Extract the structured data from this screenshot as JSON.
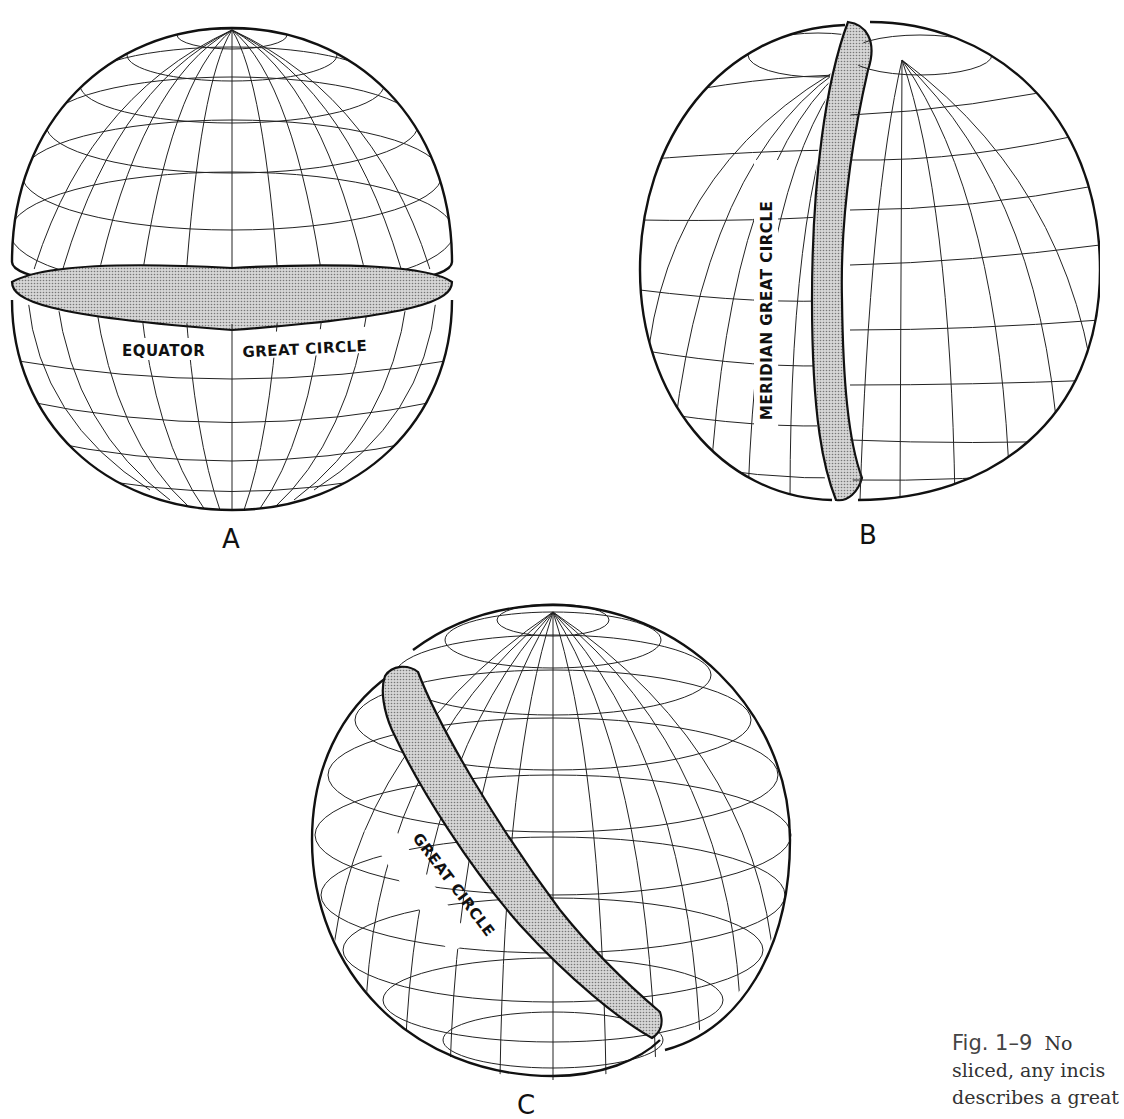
{
  "figure": {
    "number": "Fig. 1–9",
    "caption_lines": [
      "No",
      "sliced, any incis",
      "describes a great"
    ]
  },
  "panels": [
    {
      "id": "A",
      "letter": "A",
      "band_label_left": "EQUATOR",
      "band_label_right": "GREAT CIRCLE",
      "band_type": "equator"
    },
    {
      "id": "B",
      "letter": "B",
      "band_label": "MERIDIAN GREAT CIRCLE",
      "band_type": "meridian"
    },
    {
      "id": "C",
      "letter": "C",
      "band_label": "GREAT CIRCLE",
      "band_type": "oblique"
    }
  ],
  "colors": {
    "ink": "#111111",
    "band_fill": "#c8c8c8",
    "paper": "#ffffff"
  }
}
